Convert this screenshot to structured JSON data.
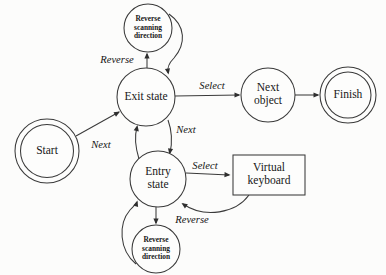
{
  "diagram": {
    "background_color": "#fcfcfb",
    "stroke_color": "#3a3a3a",
    "text_color": "#171717",
    "nodes": [
      {
        "id": "start",
        "label": "Start",
        "shape": "double-circle",
        "cx": 47,
        "cy": 151,
        "r": 32,
        "r_inner": 26.5,
        "label_lines": [
          "Start"
        ]
      },
      {
        "id": "reverse-top",
        "label": "Reverse scanning direction",
        "shape": "circle",
        "cx": 148,
        "cy": 28,
        "r": 24,
        "label_lines": [
          "Reverse",
          "scanning",
          "direction"
        ]
      },
      {
        "id": "exit-state",
        "label": "Exit state",
        "shape": "circle",
        "cx": 146,
        "cy": 97,
        "r": 29,
        "label_lines": [
          "Exit state"
        ]
      },
      {
        "id": "entry-state",
        "label": "Entry state",
        "shape": "circle",
        "cx": 158,
        "cy": 179,
        "r": 28,
        "label_lines": [
          "Entry",
          "state"
        ]
      },
      {
        "id": "reverse-bottom",
        "label": "Reverse scanning direction",
        "shape": "circle",
        "cx": 156,
        "cy": 249,
        "r": 24,
        "label_lines": [
          "Reverse",
          "scanning",
          "direction"
        ]
      },
      {
        "id": "next-object",
        "label": "Next object",
        "shape": "circle",
        "cx": 268,
        "cy": 95,
        "r": 27,
        "label_lines": [
          "Next",
          "object"
        ]
      },
      {
        "id": "finish",
        "label": "Finish",
        "shape": "double-circle",
        "cx": 348,
        "cy": 95,
        "r": 28,
        "r_inner": 23,
        "label_lines": [
          "Finish"
        ]
      },
      {
        "id": "virtual-keyboard",
        "label": "Virtual keyboard",
        "shape": "rect",
        "x": 233,
        "y": 155,
        "w": 72,
        "h": 40,
        "label_lines": [
          "Virtual",
          "keyboard"
        ]
      }
    ],
    "edges": [
      {
        "id": "start-to-exit",
        "from": "start",
        "to": "exit-state",
        "label": "Next",
        "label_x": 101,
        "label_y": 146,
        "path": "M 76 136 L 119 112",
        "arrow": {
          "x": 120,
          "y": 111.5,
          "angle": -29
        }
      },
      {
        "id": "exit-to-reverse-top",
        "from": "exit-state",
        "to": "reverse-top",
        "label": "Reverse",
        "label_x": 117,
        "label_y": 61,
        "path": "M 147 68 L 147 54",
        "arrow": {
          "x": 147,
          "y": 52.5,
          "angle": -90
        }
      },
      {
        "id": "reverse-top-to-exit",
        "from": "reverse-top",
        "to": "exit-state",
        "label": "",
        "label_x": 0,
        "label_y": 0,
        "path": "M 169 14 C 186 26, 186 44, 174 58 C 168 64, 167 68, 168 73",
        "arrow": {
          "x": 168.5,
          "y": 74.5,
          "angle": 80
        }
      },
      {
        "id": "exit-to-next-object",
        "from": "exit-state",
        "to": "next-object",
        "label": "Select",
        "label_x": 212,
        "label_y": 87,
        "path": "M 175 96 L 239 95",
        "arrow": {
          "x": 240.5,
          "y": 95,
          "angle": 0
        }
      },
      {
        "id": "next-object-to-finish",
        "from": "next-object",
        "to": "finish",
        "label": "",
        "label_x": 0,
        "label_y": 0,
        "path": "M 295 95 L 318 95",
        "arrow": {
          "x": 319.5,
          "y": 95,
          "angle": 0
        }
      },
      {
        "id": "entry-to-exit",
        "from": "entry-state",
        "to": "exit-state",
        "label": "",
        "label_x": 0,
        "label_y": 0,
        "path": "M 139 159 C 135 146, 135 134, 137 127",
        "arrow": {
          "x": 137.5,
          "y": 125,
          "angle": -78
        }
      },
      {
        "id": "exit-to-entry",
        "from": "exit-state",
        "to": "entry-state",
        "label": "Next",
        "label_x": 186,
        "label_y": 131,
        "path": "M 168 120 C 172 131, 172 144, 170 153",
        "arrow": {
          "x": 169.5,
          "y": 154.5,
          "angle": 100
        }
      },
      {
        "id": "entry-to-virtual-keyboard",
        "from": "entry-state",
        "to": "virtual-keyboard",
        "label": "Select",
        "label_x": 205,
        "label_y": 167,
        "path": "M 186 173 L 229 175",
        "arrow": {
          "x": 230.5,
          "y": 175,
          "angle": 3
        }
      },
      {
        "id": "virtual-keyboard-to-entry",
        "from": "virtual-keyboard",
        "to": "entry-state",
        "label": "Reverse",
        "label_x": 192,
        "label_y": 221,
        "path": "M 249 195 C 236 213, 205 219, 183 204",
        "arrow": {
          "x": 181.5,
          "y": 203,
          "angle": 215
        }
      },
      {
        "id": "entry-to-reverse-bottom",
        "from": "entry-state",
        "to": "reverse-bottom",
        "label": "",
        "label_x": 0,
        "label_y": 0,
        "path": "M 156 207 L 156 223",
        "arrow": {
          "x": 156,
          "y": 224.5,
          "angle": 90
        }
      },
      {
        "id": "reverse-bottom-to-entry",
        "from": "reverse-bottom",
        "to": "entry-state",
        "label": "",
        "label_x": 0,
        "label_y": 0,
        "path": "M 136 264 C 119 250, 118 224, 130 210 C 134 206, 136 204, 137 202",
        "arrow": {
          "x": 137.5,
          "y": 200.5,
          "angle": -72
        }
      }
    ]
  }
}
